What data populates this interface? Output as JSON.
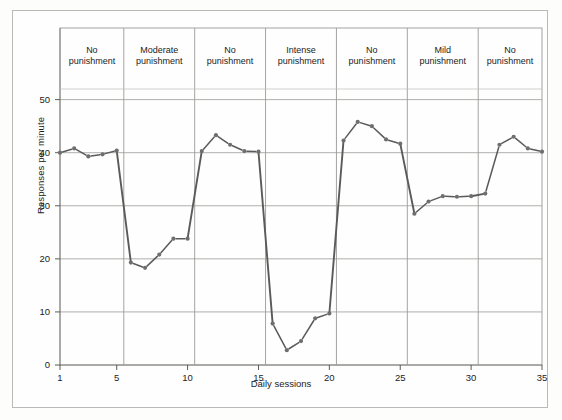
{
  "chart_data": {
    "type": "line",
    "title": "",
    "xlabel": "Daily sessions",
    "ylabel": "Responses per minute",
    "xlim": [
      1,
      35
    ],
    "ylim": [
      0,
      52
    ],
    "xticks": [
      1,
      5,
      10,
      15,
      20,
      25,
      30,
      35
    ],
    "yticks": [
      0,
      10,
      20,
      30,
      40,
      50
    ],
    "grid": "horizontal gridlines at y ticks plus vertical phase dividers",
    "legend": "none",
    "line_color": "#5a5a5a",
    "marker_color": "#6e6e6e",
    "x": [
      1,
      2,
      3,
      4,
      5,
      6,
      7,
      8,
      9,
      10,
      11,
      12,
      13,
      14,
      15,
      16,
      17,
      18,
      19,
      20,
      21,
      22,
      23,
      24,
      25,
      26,
      27,
      28,
      29,
      30,
      31,
      32,
      33,
      34,
      35
    ],
    "values": [
      40.0,
      40.8,
      39.3,
      39.7,
      40.4,
      19.3,
      18.3,
      20.8,
      23.8,
      23.8,
      40.3,
      43.3,
      41.5,
      40.3,
      40.2,
      7.8,
      2.8,
      4.5,
      8.8,
      9.7,
      42.3,
      45.8,
      45.0,
      42.5,
      41.7,
      28.5,
      30.8,
      31.8,
      31.7,
      31.8,
      32.3,
      41.5,
      43.0,
      40.8,
      40.2
    ],
    "phases": [
      {
        "label_line1": "No",
        "label_line2": "punishment",
        "start": 1,
        "end": 5
      },
      {
        "label_line1": "Moderate",
        "label_line2": "punishment",
        "start": 6,
        "end": 10
      },
      {
        "label_line1": "No",
        "label_line2": "punishment",
        "start": 11,
        "end": 15
      },
      {
        "label_line1": "Intense",
        "label_line2": "punishment",
        "start": 16,
        "end": 20
      },
      {
        "label_line1": "No",
        "label_line2": "punishment",
        "start": 21,
        "end": 25
      },
      {
        "label_line1": "Mild",
        "label_line2": "punishment",
        "start": 26,
        "end": 30
      },
      {
        "label_line1": "No",
        "label_line2": "punishment",
        "start": 31,
        "end": 35
      }
    ]
  }
}
